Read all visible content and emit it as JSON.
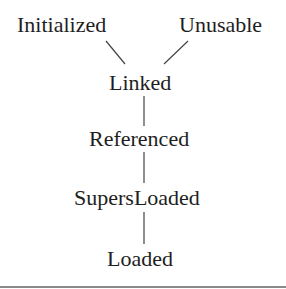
{
  "diagram": {
    "type": "hierarchy",
    "nodes": {
      "initialized": "Initialized",
      "unusable": "Unusable",
      "linked": "Linked",
      "referenced": "Referenced",
      "supers_loaded": "SupersLoaded",
      "loaded": "Loaded"
    },
    "edges": [
      [
        "Initialized",
        "Linked"
      ],
      [
        "Unusable",
        "Linked"
      ],
      [
        "Linked",
        "Referenced"
      ],
      [
        "Referenced",
        "SupersLoaded"
      ],
      [
        "SupersLoaded",
        "Loaded"
      ]
    ]
  },
  "colors": {
    "text": "#1e1e1e",
    "line": "#444444",
    "rule": "#8a8a8a"
  }
}
